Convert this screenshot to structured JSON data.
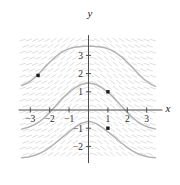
{
  "chart_data": {
    "type": "line",
    "title": "",
    "subtitle": "",
    "xlabel": "x",
    "ylabel": "y",
    "xlim": [
      -3.45,
      3.45
    ],
    "ylim": [
      -2.75,
      3.95
    ],
    "grid": false,
    "legend_position": "none",
    "x_ticks": [
      -3,
      -2,
      -1,
      1,
      2,
      3
    ],
    "x_tick_labels": [
      "−3",
      "−2",
      "−1",
      "1",
      "2",
      "3"
    ],
    "y_ticks": [
      3,
      2,
      1,
      -1,
      -2
    ],
    "y_tick_labels": [
      "3",
      "2",
      "1",
      "−1",
      "−2"
    ],
    "curve_color": "#b3b3b3",
    "slope_field_color": "#d8d8d8",
    "axis_color": "#4d4d4d",
    "point_color": "#1a1a1a",
    "series": [
      {
        "name": "upper-solution-curve",
        "through_point": [
          -2.6,
          1.9
        ],
        "peak": [
          0,
          3.5
        ],
        "values_x": [
          -3.45,
          -3.1,
          -2.8,
          -2.6,
          -2.3,
          -2.0,
          -1.7,
          -1.4,
          -1.1,
          -0.8,
          -0.5,
          -0.2,
          0,
          0.2,
          0.5,
          0.8,
          1.1,
          1.4,
          1.7,
          2.0,
          2.3,
          2.6,
          2.9,
          3.2,
          3.45
        ],
        "values_y": [
          1.35,
          1.5,
          1.75,
          1.95,
          2.3,
          2.62,
          2.92,
          3.16,
          3.33,
          3.43,
          3.48,
          3.5,
          3.5,
          3.5,
          3.48,
          3.43,
          3.33,
          3.16,
          2.92,
          2.62,
          2.3,
          1.95,
          1.65,
          1.42,
          1.3
        ]
      },
      {
        "name": "middle-solution-curve",
        "through_point": [
          1,
          1
        ],
        "peak": [
          0,
          1.48
        ],
        "values_x": [
          -3.45,
          -3.1,
          -2.8,
          -2.5,
          -2.2,
          -1.9,
          -1.6,
          -1.3,
          -1.0,
          -0.7,
          -0.4,
          -0.1,
          0,
          0.1,
          0.4,
          0.7,
          1.0,
          1.3,
          1.6,
          1.9,
          2.2,
          2.5,
          2.8,
          3.1,
          3.45
        ],
        "values_y": [
          -1.05,
          -0.95,
          -0.82,
          -0.62,
          -0.35,
          -0.02,
          0.33,
          0.68,
          0.98,
          1.22,
          1.4,
          1.47,
          1.48,
          1.47,
          1.4,
          1.22,
          0.98,
          0.68,
          0.33,
          -0.02,
          -0.35,
          -0.62,
          -0.82,
          -0.95,
          -1.05
        ]
      },
      {
        "name": "lower-solution-curve",
        "through_point": [
          1,
          -1
        ],
        "peak": [
          0,
          -0.62
        ],
        "values_x": [
          -3.45,
          -3.1,
          -2.8,
          -2.5,
          -2.2,
          -1.9,
          -1.6,
          -1.3,
          -1.0,
          -0.7,
          -0.4,
          -0.1,
          0,
          0.1,
          0.4,
          0.7,
          1.0,
          1.3,
          1.6,
          1.9,
          2.2,
          2.5,
          2.8,
          3.1,
          3.45
        ],
        "values_y": [
          -2.62,
          -2.58,
          -2.5,
          -2.38,
          -2.2,
          -1.98,
          -1.72,
          -1.45,
          -1.2,
          -0.95,
          -0.75,
          -0.64,
          -0.62,
          -0.64,
          -0.75,
          -0.95,
          -1.2,
          -1.45,
          -1.72,
          -1.98,
          -2.2,
          -2.38,
          -2.5,
          -2.58,
          -2.62
        ]
      }
    ],
    "points": [
      {
        "label": "",
        "x": -2.6,
        "y": 1.9
      },
      {
        "label": "",
        "x": 1.0,
        "y": 1.0
      },
      {
        "label": "",
        "x": 1.0,
        "y": -1.0
      }
    ]
  }
}
